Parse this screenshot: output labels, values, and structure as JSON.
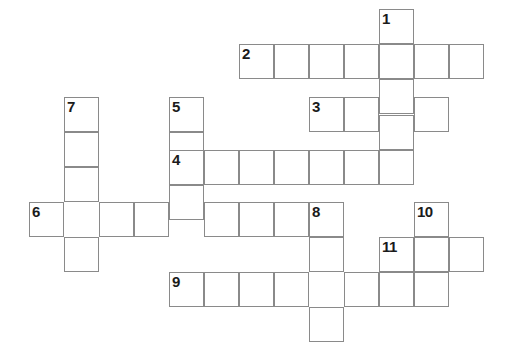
{
  "puzzle": {
    "type": "crossword-grid",
    "cell_size_px": 35,
    "grid_origin": {
      "x": 29,
      "y": 9
    },
    "grid_columns_px": [
      29,
      64,
      99,
      134,
      169,
      204,
      239,
      274,
      309,
      344,
      379,
      414,
      449
    ],
    "grid_rows_px": [
      9,
      44,
      79,
      97,
      132,
      150,
      185,
      202,
      237,
      272,
      307
    ],
    "colors": {
      "background": "#ffffff",
      "cell_fill": "#ffffff",
      "cell_border": "#8a8a8a",
      "number_text": "#1b1b1b"
    },
    "numbers_visible": [
      "1",
      "2",
      "3",
      "4",
      "5",
      "6",
      "7",
      "8",
      "9",
      "10",
      "11"
    ],
    "entries": [
      {
        "number": "1",
        "direction": "down",
        "length": 5,
        "start": {
          "x": 379,
          "y": 9
        }
      },
      {
        "number": "2",
        "direction": "across",
        "length": 7,
        "start": {
          "x": 239,
          "y": 44
        }
      },
      {
        "number": "3",
        "direction": "across",
        "length": 4,
        "start": {
          "x": 309,
          "y": 97
        }
      },
      {
        "number": "4",
        "direction": "across",
        "length": 7,
        "start": {
          "x": 169,
          "y": 150
        }
      },
      {
        "number": "5",
        "direction": "down",
        "length": 3,
        "start": {
          "x": 169,
          "y": 97
        }
      },
      {
        "number": "6",
        "direction": "across",
        "length": 9,
        "start": {
          "x": 29,
          "y": 202
        }
      },
      {
        "number": "7",
        "direction": "down",
        "length": 5,
        "start": {
          "x": 64,
          "y": 97
        }
      },
      {
        "number": "8",
        "direction": "down",
        "length": 4,
        "start": {
          "x": 309,
          "y": 202
        }
      },
      {
        "number": "9",
        "direction": "across",
        "length": 8,
        "start": {
          "x": 169,
          "y": 272
        }
      },
      {
        "number": "10",
        "direction": "down",
        "length": 3,
        "start": {
          "x": 414,
          "y": 202
        }
      },
      {
        "number": "11",
        "direction": "across",
        "length": 3,
        "start": {
          "x": 379,
          "y": 237
        }
      }
    ],
    "cells": [
      {
        "x": 379,
        "y": 9,
        "number": "1",
        "letter": ""
      },
      {
        "x": 379,
        "y": 44,
        "number": "",
        "letter": ""
      },
      {
        "x": 379,
        "y": 79,
        "number": "",
        "letter": ""
      },
      {
        "x": 379,
        "y": 115,
        "number": "",
        "letter": ""
      },
      {
        "x": 379,
        "y": 150,
        "number": "",
        "letter": ""
      },
      {
        "x": 239,
        "y": 44,
        "number": "2",
        "letter": ""
      },
      {
        "x": 274,
        "y": 44,
        "number": "",
        "letter": ""
      },
      {
        "x": 309,
        "y": 44,
        "number": "",
        "letter": ""
      },
      {
        "x": 344,
        "y": 44,
        "number": "",
        "letter": ""
      },
      {
        "x": 414,
        "y": 44,
        "number": "",
        "letter": ""
      },
      {
        "x": 449,
        "y": 44,
        "number": "",
        "letter": ""
      },
      {
        "x": 309,
        "y": 97,
        "number": "3",
        "letter": ""
      },
      {
        "x": 344,
        "y": 97,
        "number": "",
        "letter": ""
      },
      {
        "x": 414,
        "y": 97,
        "number": "",
        "letter": ""
      },
      {
        "x": 64,
        "y": 97,
        "number": "7",
        "letter": ""
      },
      {
        "x": 64,
        "y": 132,
        "number": "",
        "letter": ""
      },
      {
        "x": 64,
        "y": 167,
        "number": "",
        "letter": ""
      },
      {
        "x": 64,
        "y": 237,
        "number": "",
        "letter": ""
      },
      {
        "x": 169,
        "y": 97,
        "number": "5",
        "letter": ""
      },
      {
        "x": 169,
        "y": 132,
        "number": "",
        "letter": ""
      },
      {
        "x": 169,
        "y": 185,
        "number": "",
        "letter": ""
      },
      {
        "x": 169,
        "y": 150,
        "number": "4",
        "letter": ""
      },
      {
        "x": 204,
        "y": 150,
        "number": "",
        "letter": ""
      },
      {
        "x": 239,
        "y": 150,
        "number": "",
        "letter": ""
      },
      {
        "x": 274,
        "y": 150,
        "number": "",
        "letter": ""
      },
      {
        "x": 309,
        "y": 150,
        "number": "",
        "letter": ""
      },
      {
        "x": 344,
        "y": 150,
        "number": "",
        "letter": ""
      },
      {
        "x": 29,
        "y": 202,
        "number": "6",
        "letter": ""
      },
      {
        "x": 99,
        "y": 202,
        "number": "",
        "letter": ""
      },
      {
        "x": 134,
        "y": 202,
        "number": "",
        "letter": ""
      },
      {
        "x": 204,
        "y": 202,
        "number": "",
        "letter": ""
      },
      {
        "x": 239,
        "y": 202,
        "number": "",
        "letter": ""
      },
      {
        "x": 274,
        "y": 202,
        "number": "",
        "letter": ""
      },
      {
        "x": 309,
        "y": 202,
        "number": "8",
        "letter": ""
      },
      {
        "x": 309,
        "y": 237,
        "number": "",
        "letter": ""
      },
      {
        "x": 309,
        "y": 307,
        "number": "",
        "letter": ""
      },
      {
        "x": 414,
        "y": 202,
        "number": "10",
        "letter": ""
      },
      {
        "x": 414,
        "y": 237,
        "number": "",
        "letter": ""
      },
      {
        "x": 379,
        "y": 237,
        "number": "11",
        "letter": ""
      },
      {
        "x": 449,
        "y": 237,
        "number": "",
        "letter": ""
      },
      {
        "x": 169,
        "y": 272,
        "number": "9",
        "letter": ""
      },
      {
        "x": 204,
        "y": 272,
        "number": "",
        "letter": ""
      },
      {
        "x": 239,
        "y": 272,
        "number": "",
        "letter": ""
      },
      {
        "x": 274,
        "y": 272,
        "number": "",
        "letter": ""
      },
      {
        "x": 344,
        "y": 272,
        "number": "",
        "letter": ""
      },
      {
        "x": 379,
        "y": 272,
        "number": "",
        "letter": ""
      },
      {
        "x": 414,
        "y": 272,
        "number": "",
        "letter": ""
      }
    ]
  }
}
